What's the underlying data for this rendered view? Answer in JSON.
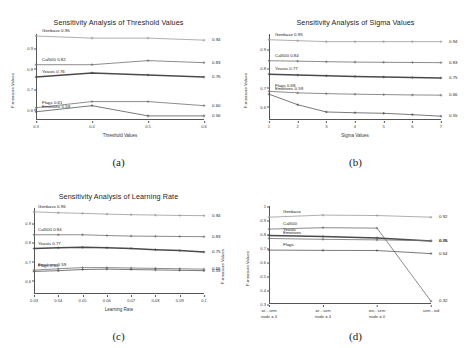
{
  "figure": {
    "panels": [
      "(a)",
      "(b)",
      "(c)",
      "(d)"
    ]
  },
  "chart_data": [
    {
      "type": "line",
      "panel": "(a)",
      "title": "Sensitivity Analysis of Threshold Values",
      "xlabel": "Threshold Values",
      "ylabel": "F-measure Values",
      "x": [
        0.3,
        0.4,
        0.5,
        0.6
      ],
      "xticklabels": [
        "0.3",
        "0.4",
        "0.5",
        "0.6"
      ],
      "yticklabels": [
        "0.9",
        "0.8",
        "0.7",
        "0.6"
      ],
      "ylim": [
        0.55,
        0.97
      ],
      "grid": false,
      "legend": "inline-start-and-end-labels",
      "series": [
        {
          "name": "Genbase",
          "start_label": "Genbase 0.96",
          "end_label": "0.94",
          "values": [
            0.96,
            0.95,
            0.95,
            0.94
          ]
        },
        {
          "name": "Cal500",
          "start_label": "Cal500 0.82",
          "end_label": "0.83",
          "values": [
            0.82,
            0.82,
            0.84,
            0.83
          ]
        },
        {
          "name": "Yeasts",
          "start_label": "Yeasts 0.76",
          "end_label": "0.76",
          "values": [
            0.76,
            0.78,
            0.77,
            0.76
          ]
        },
        {
          "name": "Flags",
          "start_label": "Flags 0.61",
          "end_label": "0.60",
          "values": [
            0.61,
            0.64,
            0.64,
            0.62
          ]
        },
        {
          "name": "Emotions",
          "start_label": "Emotions 0.59",
          "end_label": "0.56",
          "values": [
            0.59,
            0.62,
            0.57,
            0.57
          ]
        }
      ]
    },
    {
      "type": "line",
      "panel": "(b)",
      "title": "Sensitivity Analysis of Sigma Values",
      "xlabel": "Sigma Values",
      "ylabel": "F-measure Values",
      "x": [
        1,
        2,
        3,
        4,
        5,
        6,
        7
      ],
      "xticklabels": [
        "1",
        "2",
        "3",
        "4",
        "5",
        "6",
        "7"
      ],
      "yticklabels": [
        "0.9",
        "0.8",
        "0.7",
        "0.6"
      ],
      "ylim": [
        0.53,
        0.98
      ],
      "grid": false,
      "legend": "inline-start-and-end-labels",
      "series": [
        {
          "name": "Genbase",
          "start_label": "Genbase 0.95",
          "end_label": "0.94",
          "values": [
            0.95,
            0.945,
            0.94,
            0.94,
            0.94,
            0.94,
            0.94
          ]
        },
        {
          "name": "Cal500",
          "start_label": "Cal500 0.84",
          "end_label": "0.83",
          "values": [
            0.84,
            0.838,
            0.835,
            0.833,
            0.832,
            0.831,
            0.83
          ]
        },
        {
          "name": "Yeasts",
          "start_label": "Yeasts 0.77",
          "end_label": "0.75",
          "values": [
            0.77,
            0.765,
            0.762,
            0.758,
            0.755,
            0.752,
            0.75
          ]
        },
        {
          "name": "Flags",
          "start_label": "Flags 0.68",
          "end_label": "0.66",
          "values": [
            0.68,
            0.672,
            0.668,
            0.665,
            0.663,
            0.661,
            0.66
          ]
        },
        {
          "name": "Emotions",
          "start_label": "Emotions 0.59",
          "end_label": "0.55",
          "values": [
            0.665,
            0.61,
            0.572,
            0.568,
            0.565,
            0.558,
            0.55
          ]
        }
      ]
    },
    {
      "type": "line",
      "panel": "(c)",
      "title": "Sensitivity Analysis of Learning Rate",
      "xlabel": "Learning Rate",
      "ylabel": "F-measure Values",
      "x": [
        0.03,
        0.04,
        0.05,
        0.06,
        0.07,
        0.08,
        0.09,
        0.1
      ],
      "xticklabels": [
        "0.03",
        "0.04",
        "0.05",
        "0.06",
        "0.07",
        "0.08",
        "0.09",
        "0.1"
      ],
      "yticklabels": [
        "0.9",
        "0.8",
        "0.7",
        "0.6"
      ],
      "ylim": [
        0.53,
        0.98
      ],
      "grid": false,
      "legend": "inline-start-and-end-labels",
      "series": [
        {
          "name": "Genbase",
          "start_label": "Genbase 0.96",
          "end_label": "0.94",
          "values": [
            0.96,
            0.955,
            0.952,
            0.948,
            0.945,
            0.943,
            0.941,
            0.94
          ]
        },
        {
          "name": "Cal500",
          "start_label": "Cal500 0.84",
          "end_label": "0.83",
          "values": [
            0.84,
            0.84,
            0.84,
            0.836,
            0.833,
            0.832,
            0.831,
            0.83
          ]
        },
        {
          "name": "Yeasts",
          "start_label": "Yeasts 0.77",
          "end_label": "0.75",
          "values": [
            0.768,
            0.772,
            0.774,
            0.772,
            0.768,
            0.762,
            0.757,
            0.75
          ]
        },
        {
          "name": "Emotions",
          "start_label": "Emotions 0.59",
          "end_label": "0.66",
          "values": [
            0.655,
            0.662,
            0.668,
            0.668,
            0.666,
            0.664,
            0.662,
            0.66
          ]
        },
        {
          "name": "Flags",
          "start_label": "Flags 0.68",
          "end_label": "0.55",
          "values": [
            0.648,
            0.652,
            0.658,
            0.66,
            0.658,
            0.656,
            0.654,
            0.652
          ]
        }
      ]
    },
    {
      "type": "line",
      "panel": "(d)",
      "title": "",
      "xlabel": "",
      "ylabel": "F-measure Values",
      "x": [
        0,
        1,
        2,
        3
      ],
      "xticklabels": [
        "wi - sem\nnode = 4",
        "wi - sem\nnode = 4",
        "wo - sem\nnode = 0",
        "sem - wd"
      ],
      "yticklabels": [
        "1",
        "0.9",
        "0.8",
        "0.7",
        "0.6",
        "0.5",
        "0.4",
        "0.3"
      ],
      "ylim": [
        0.3,
        1.0
      ],
      "grid": false,
      "legend": "inline-start-and-end-labels",
      "series": [
        {
          "name": "Genbase",
          "start_label": "Genbase",
          "end_label": "0.92",
          "values": [
            0.92,
            0.935,
            0.932,
            0.92
          ]
        },
        {
          "name": "Cal500",
          "start_label": "Cal500",
          "end_label": "0.32",
          "values": [
            0.835,
            0.845,
            0.842,
            0.32
          ]
        },
        {
          "name": "Yeasts",
          "start_label": "Yeasts",
          "end_label": "0.75",
          "values": [
            0.79,
            0.782,
            0.772,
            0.75
          ]
        },
        {
          "name": "Emotions",
          "start_label": "Emotions",
          "end_label": "0.66",
          "values": [
            0.768,
            0.762,
            0.758,
            0.752
          ]
        },
        {
          "name": "Flags",
          "start_label": "Flags",
          "end_label": "0.64",
          "values": [
            0.685,
            0.683,
            0.682,
            0.66
          ]
        }
      ]
    }
  ],
  "style": {
    "line_colors": [
      "#9a9a9a",
      "#6e6e6e",
      "#4a4a4a",
      "#707070",
      "#585858"
    ],
    "axis_color": "#555555",
    "text_color": "#2a2a2a"
  }
}
